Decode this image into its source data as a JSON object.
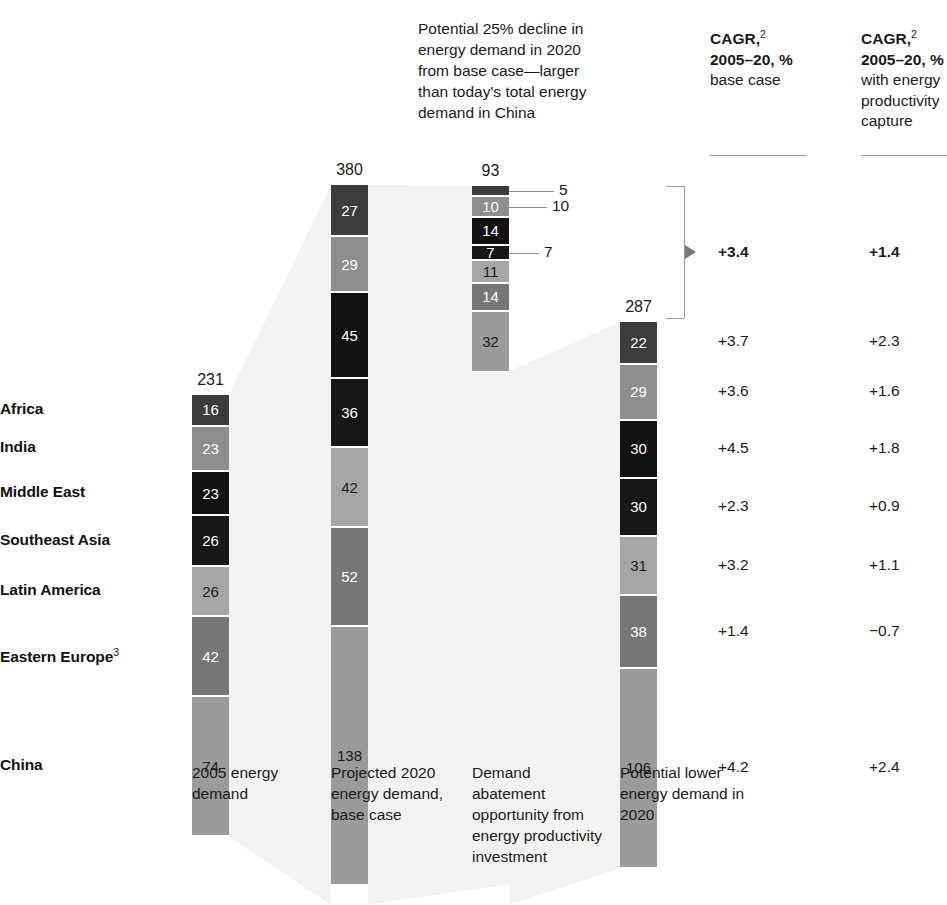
{
  "callout": {
    "text": "Potential 25% decline in energy demand in 2020 from base case—larger than today's total energy demand in China"
  },
  "cagr_headers": [
    {
      "line1": "CAGR,",
      "sup": "2",
      "line2": "2005–20, %",
      "line3": "base case"
    },
    {
      "line1": "CAGR,",
      "sup": "2",
      "line2": "2005–20, %",
      "line3": "with energy productivity capture"
    }
  ],
  "row_labels": [
    {
      "label": "Africa",
      "sup": ""
    },
    {
      "label": "India",
      "sup": ""
    },
    {
      "label": "Middle East",
      "sup": ""
    },
    {
      "label": "Southeast Asia",
      "sup": ""
    },
    {
      "label": "Latin America",
      "sup": ""
    },
    {
      "label": "Eastern Europe",
      "sup": "3"
    },
    {
      "label": "China",
      "sup": ""
    }
  ],
  "axis_captions": [
    "2005 energy demand",
    "Projected 2020 energy demand, base case",
    "Demand abatement opportunity from energy productivity investment",
    "Potential lower energy demand in 2020"
  ],
  "cagr_values": {
    "total": {
      "base_case": "+3.4",
      "with_capture": "+1.4"
    },
    "rows": [
      {
        "base_case": "+3.7",
        "with_capture": "+2.3"
      },
      {
        "base_case": "+3.6",
        "with_capture": "+1.6"
      },
      {
        "base_case": "+4.5",
        "with_capture": "+1.8"
      },
      {
        "base_case": "+2.3",
        "with_capture": "+0.9"
      },
      {
        "base_case": "+3.2",
        "with_capture": "+1.1"
      },
      {
        "base_case": "+1.4",
        "with_capture": "−0.7"
      },
      {
        "base_case": "+4.2",
        "with_capture": "+2.4"
      }
    ]
  },
  "chart_data": {
    "type": "bar",
    "title": "",
    "xlabel": "",
    "ylabel": "",
    "stacked": true,
    "orientation": "vertical",
    "grid": false,
    "legend": "row-labels-left",
    "categories": [
      "2005 energy demand",
      "Projected 2020 energy demand, base case",
      "Demand abatement opportunity from energy productivity investment",
      "Potential lower energy demand in 2020"
    ],
    "totals": [
      231,
      380,
      93,
      287
    ],
    "series": [
      {
        "name": "Africa",
        "color": "#3c3c3c",
        "values": [
          16,
          27,
          5,
          22
        ]
      },
      {
        "name": "India",
        "color": "#8e8e8e",
        "values": [
          23,
          29,
          10,
          29
        ]
      },
      {
        "name": "Middle East",
        "color": "#121212",
        "values": [
          23,
          45,
          14,
          30
        ]
      },
      {
        "name": "Southeast Asia",
        "color": "#171717",
        "values": [
          26,
          36,
          7,
          30
        ]
      },
      {
        "name": "Latin America",
        "color": "#a6a6a6",
        "values": [
          26,
          42,
          11,
          31
        ]
      },
      {
        "name": "Eastern Europe",
        "color": "#767676",
        "values": [
          42,
          52,
          14,
          38
        ]
      },
      {
        "name": "China",
        "color": "#9b9b9b",
        "values": [
          74,
          138,
          32,
          106
        ]
      }
    ],
    "callout_values": [
      {
        "label": "5",
        "series": "Africa"
      },
      {
        "label": "10",
        "series": "India"
      },
      {
        "label": "7",
        "series": "Southeast Asia"
      }
    ],
    "annotation": "Potential 25% decline in energy demand in 2020 from base case—larger than today's total energy demand in China"
  },
  "colors": {
    "bar_africa": "#3c3c3c",
    "bar_india": "#8e8e8e",
    "bar_middle_east": "#121212",
    "bar_southeast_asia": "#171717",
    "bar_latin_america": "#a6a6a6",
    "bar_eastern_europe": "#767676",
    "bar_china": "#9b9b9b",
    "connector": "#f2f2f2",
    "rule": "#9a9a9a"
  }
}
